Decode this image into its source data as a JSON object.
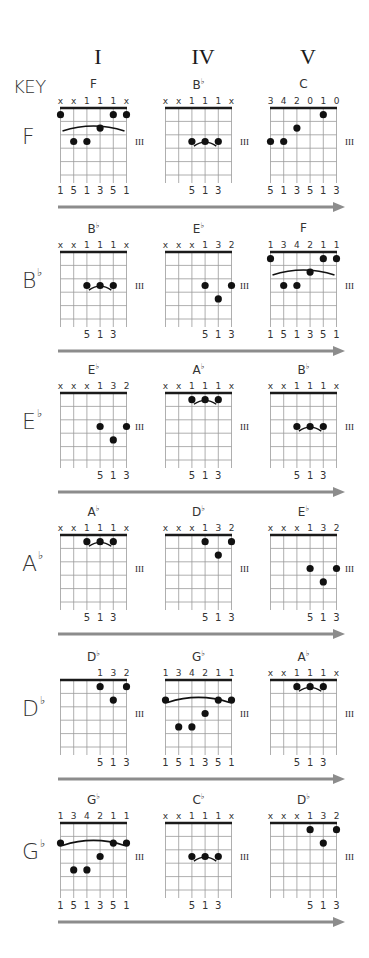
{
  "header": {
    "key_label": "KEY",
    "columns": [
      "I",
      "IV",
      "V"
    ]
  },
  "style": {
    "arrow_color": "#8c8c8c",
    "grid_color": "#9a9a9a",
    "nut_color": "#1a1a1a",
    "dot_color": "#111111",
    "position_marker": "III"
  },
  "rows": [
    {
      "key": "F",
      "key_flat": false,
      "chords": [
        {
          "name": "F",
          "flat": false,
          "top": [
            "x",
            "x",
            "1",
            "1",
            "1",
            "x"
          ],
          "dots": [
            [
              1,
              1
            ],
            [
              6,
              1
            ],
            [
              5,
              2
            ],
            [
              2,
              3
            ],
            [
              3,
              3
            ],
            [
              4,
              3
            ]
          ],
          "dotsOrder": "string,fret",
          "raw_dots": [
            [
              0,
              1
            ],
            [
              5,
              1
            ],
            [
              4,
              1.75
            ],
            [
              3,
              2.0
            ]
          ],
          "bottom": [
            "1",
            "5",
            "1",
            "3",
            "5",
            "1"
          ],
          "arc": {
            "from": 0,
            "to": 5,
            "fret": 0.9
          }
        },
        {
          "name": "B",
          "flat": true,
          "top": [
            "x",
            "x",
            "1",
            "1",
            "1",
            "x"
          ],
          "bottom": [
            "",
            "",
            "5",
            "1",
            "3",
            ""
          ],
          "arc": {
            "from": 2,
            "to": 4,
            "fret": 2.1
          }
        },
        {
          "name": "C",
          "flat": false,
          "top": [
            "3",
            "4",
            "2",
            "0",
            "1",
            "0"
          ],
          "bottom": [
            "5",
            "1",
            "3",
            "5",
            "1",
            "3"
          ],
          "arc": null
        }
      ]
    },
    {
      "key": "B",
      "key_flat": true,
      "chords": [
        {
          "name": "B",
          "flat": true,
          "top": [
            "x",
            "x",
            "1",
            "1",
            "1",
            "x"
          ],
          "bottom": [
            "",
            "",
            "5",
            "1",
            "3",
            ""
          ],
          "arc": {
            "from": 2,
            "to": 4,
            "fret": 2.1
          }
        },
        {
          "name": "E",
          "flat": true,
          "top": [
            "x",
            "x",
            "x",
            "1",
            "3",
            "2"
          ],
          "bottom": [
            "",
            "",
            "",
            "5",
            "1",
            "3"
          ],
          "arc": null
        },
        {
          "name": "F",
          "flat": false,
          "top": [
            "1",
            "3",
            "4",
            "2",
            "1",
            "1"
          ],
          "bottom": [
            "1",
            "5",
            "1",
            "3",
            "5",
            "1"
          ],
          "arc": {
            "from": 0,
            "to": 5,
            "fret": 0.9
          }
        }
      ]
    },
    {
      "key": "E",
      "key_flat": true,
      "chords": [
        {
          "name": "E",
          "flat": true,
          "top": [
            "x",
            "x",
            "x",
            "1",
            "3",
            "2"
          ],
          "bottom": [
            "",
            "",
            "",
            "5",
            "1",
            "3"
          ],
          "arc": null
        },
        {
          "name": "A",
          "flat": true,
          "top": [
            "x",
            "x",
            "1",
            "1",
            "1",
            "x"
          ],
          "bottom": [
            "",
            "",
            "5",
            "1",
            "3",
            ""
          ],
          "arc": {
            "from": 2,
            "to": 4,
            "fret": 0.1
          }
        },
        {
          "name": "B",
          "flat": true,
          "top": [
            "x",
            "x",
            "1",
            "1",
            "1",
            "x"
          ],
          "bottom": [
            "",
            "",
            "5",
            "1",
            "3",
            ""
          ],
          "arc": {
            "from": 2,
            "to": 4,
            "fret": 2.1
          }
        }
      ]
    },
    {
      "key": "A",
      "key_flat": true,
      "chords": [
        {
          "name": "A",
          "flat": true,
          "top": [
            "x",
            "x",
            "1",
            "1",
            "1",
            "x"
          ],
          "bottom": [
            "",
            "",
            "5",
            "1",
            "3",
            ""
          ],
          "arc": {
            "from": 2,
            "to": 4,
            "fret": 0.1
          }
        },
        {
          "name": "D",
          "flat": true,
          "top": [
            "x",
            "x",
            "x",
            "1",
            "3",
            "2"
          ],
          "bottom": [
            "",
            "",
            "",
            "5",
            "1",
            "3"
          ],
          "arc": null
        },
        {
          "name": "E",
          "flat": true,
          "top": [
            "x",
            "x",
            "x",
            "1",
            "3",
            "2"
          ],
          "bottom": [
            "",
            "",
            "",
            "5",
            "1",
            "3"
          ],
          "arc": null
        }
      ]
    },
    {
      "key": "D",
      "key_flat": true,
      "chords": [
        {
          "name": "D",
          "flat": true,
          "top": [
            "",
            "",
            "",
            "1",
            "3",
            "2"
          ],
          "bottom": [
            "",
            "",
            "",
            "5",
            "1",
            "3"
          ],
          "arc": null
        },
        {
          "name": "G",
          "flat": true,
          "top": [
            "1",
            "3",
            "4",
            "2",
            "1",
            "1"
          ],
          "bottom": [
            "1",
            "5",
            "1",
            "3",
            "5",
            "1"
          ],
          "arc": {
            "from": 0,
            "to": 5,
            "fret": 0.85
          }
        },
        {
          "name": "A",
          "flat": true,
          "top": [
            "x",
            "x",
            "1",
            "1",
            "1",
            "x"
          ],
          "bottom": [
            "",
            "",
            "5",
            "1",
            "3",
            ""
          ],
          "arc": {
            "from": 2,
            "to": 4,
            "fret": 0.1
          }
        }
      ]
    },
    {
      "key": "G",
      "key_flat": true,
      "chords": [
        {
          "name": "G",
          "flat": true,
          "top": [
            "1",
            "3",
            "4",
            "2",
            "1",
            "1"
          ],
          "bottom": [
            "1",
            "5",
            "1",
            "3",
            "5",
            "1"
          ],
          "arc": {
            "from": 0,
            "to": 5,
            "fret": 0.85
          }
        },
        {
          "name": "C",
          "flat": true,
          "top": [
            "x",
            "x",
            "1",
            "1",
            "1",
            "x"
          ],
          "bottom": [
            "",
            "",
            "5",
            "1",
            "3",
            ""
          ],
          "arc": {
            "from": 2,
            "to": 4,
            "fret": 2.1
          }
        },
        {
          "name": "D",
          "flat": true,
          "top": [
            "x",
            "x",
            "x",
            "1",
            "3",
            "2"
          ],
          "bottom": [
            "",
            "",
            "",
            "5",
            "1",
            "3"
          ],
          "arc": null
        }
      ]
    }
  ],
  "dots_by_diagram": [
    [
      [
        [
          0,
          1
        ],
        [
          5,
          1
        ],
        [
          4,
          1
        ],
        [
          3,
          2
        ],
        [
          1,
          3
        ],
        [
          2,
          3
        ]
      ],
      [
        [
          2,
          3
        ],
        [
          3,
          3
        ],
        [
          4,
          3
        ]
      ],
      [
        [
          4,
          1
        ],
        [
          2,
          2
        ],
        [
          0,
          3
        ],
        [
          1,
          3
        ]
      ]
    ],
    [
      [
        [
          2,
          3
        ],
        [
          3,
          3
        ],
        [
          4,
          3
        ]
      ],
      [
        [
          3,
          3
        ],
        [
          5,
          3
        ],
        [
          4,
          4
        ]
      ],
      [
        [
          0,
          1
        ],
        [
          5,
          1
        ],
        [
          4,
          1
        ],
        [
          3,
          2
        ],
        [
          1,
          3
        ],
        [
          2,
          3
        ]
      ]
    ],
    [
      [
        [
          3,
          3
        ],
        [
          5,
          3
        ],
        [
          4,
          4
        ]
      ],
      [
        [
          2,
          1
        ],
        [
          3,
          1
        ],
        [
          4,
          1
        ]
      ],
      [
        [
          2,
          3
        ],
        [
          3,
          3
        ],
        [
          4,
          3
        ]
      ]
    ],
    [
      [
        [
          2,
          1
        ],
        [
          3,
          1
        ],
        [
          4,
          1
        ]
      ],
      [
        [
          3,
          1
        ],
        [
          5,
          1
        ],
        [
          4,
          2
        ]
      ],
      [
        [
          3,
          3
        ],
        [
          5,
          3
        ],
        [
          4,
          4
        ]
      ]
    ],
    [
      [
        [
          3,
          1
        ],
        [
          5,
          1
        ],
        [
          4,
          2
        ]
      ],
      [
        [
          0,
          2
        ],
        [
          4,
          2
        ],
        [
          5,
          2
        ],
        [
          3,
          3
        ],
        [
          1,
          4
        ],
        [
          2,
          4
        ]
      ],
      [
        [
          2,
          1
        ],
        [
          3,
          1
        ],
        [
          4,
          1
        ]
      ]
    ],
    [
      [
        [
          0,
          2
        ],
        [
          4,
          2
        ],
        [
          5,
          2
        ],
        [
          3,
          3
        ],
        [
          1,
          4
        ],
        [
          2,
          4
        ]
      ],
      [
        [
          2,
          3
        ],
        [
          3,
          3
        ],
        [
          4,
          3
        ]
      ],
      [
        [
          3,
          1
        ],
        [
          5,
          1
        ],
        [
          4,
          2
        ]
      ]
    ]
  ],
  "position_marker_fret_row": [
    [
      3,
      3,
      3
    ],
    [
      3,
      3,
      3
    ],
    [
      3,
      3,
      3
    ],
    [
      3,
      3,
      3
    ],
    [
      3,
      3,
      3
    ],
    [
      3,
      3,
      3
    ]
  ]
}
